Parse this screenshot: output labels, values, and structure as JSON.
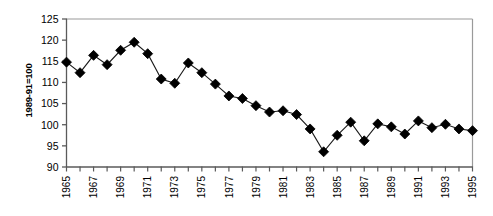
{
  "chart_data": {
    "type": "line",
    "title": "",
    "xlabel": "",
    "ylabel": "1989-91=100",
    "ylim": [
      90,
      125
    ],
    "xlim": [
      1965,
      1995
    ],
    "ytick_values": [
      90,
      95,
      100,
      105,
      110,
      115,
      120,
      125
    ],
    "ytick_labels": [
      "90",
      "95",
      "100",
      "105",
      "110",
      "115",
      "120",
      "125"
    ],
    "xtick_values": [
      1965,
      1966,
      1967,
      1968,
      1969,
      1970,
      1971,
      1972,
      1973,
      1974,
      1975,
      1976,
      1977,
      1978,
      1979,
      1980,
      1981,
      1982,
      1983,
      1984,
      1985,
      1986,
      1987,
      1988,
      1989,
      1990,
      1991,
      1992,
      1993,
      1994,
      1995
    ],
    "xtick_labels_shown": [
      "1965",
      "1967",
      "1969",
      "1971",
      "1973",
      "1975",
      "1977",
      "1979",
      "1981",
      "1983",
      "1985",
      "1987",
      "1989",
      "1991",
      "1993",
      "1995"
    ],
    "grid": false,
    "legend": false,
    "marker": "diamond",
    "marker_color": "#000000",
    "line_color": "#000000",
    "x": [
      1965,
      1966,
      1967,
      1968,
      1969,
      1970,
      1971,
      1972,
      1973,
      1974,
      1975,
      1976,
      1977,
      1978,
      1979,
      1980,
      1981,
      1982,
      1983,
      1984,
      1985,
      1986,
      1987,
      1988,
      1989,
      1990,
      1991,
      1992,
      1993,
      1994,
      1995
    ],
    "values": [
      114.8,
      112.3,
      116.4,
      114.2,
      117.6,
      119.5,
      116.8,
      110.8,
      109.8,
      114.6,
      112.3,
      109.6,
      106.8,
      106.2,
      104.5,
      103.0,
      103.3,
      102.4,
      99.0,
      93.6,
      97.5,
      100.6,
      96.2,
      100.2,
      99.5,
      97.8,
      100.9,
      99.3,
      100.1,
      99.0,
      98.6
    ],
    "series": [
      {
        "name": "Index",
        "values": [
          114.8,
          112.3,
          116.4,
          114.2,
          117.6,
          119.5,
          116.8,
          110.8,
          109.8,
          114.6,
          112.3,
          109.6,
          106.8,
          106.2,
          104.5,
          103.0,
          103.3,
          102.4,
          99.0,
          93.6,
          97.5,
          100.6,
          96.2,
          100.2,
          99.5,
          97.8,
          100.9,
          99.3,
          100.1,
          99.0,
          98.6
        ]
      }
    ]
  }
}
